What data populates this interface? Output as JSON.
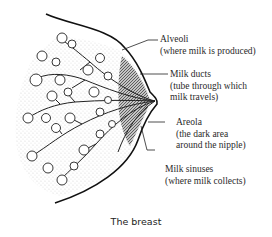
{
  "figure": {
    "caption": "The breast",
    "labels": [
      {
        "title": "Alveoli",
        "desc": "(where milk is produced)"
      },
      {
        "title": "Milk ducts",
        "desc": "(tube through which",
        "desc2": "milk travels)"
      },
      {
        "title": "Areola",
        "desc": "(the dark area",
        "desc2": "around the nipple)"
      },
      {
        "title": "Milk sinuses",
        "desc": "(where milk collects)"
      }
    ],
    "colors": {
      "ink": "#2a2a2a",
      "background": "#ffffff"
    }
  }
}
